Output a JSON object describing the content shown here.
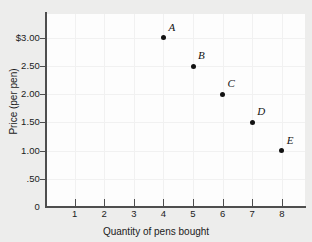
{
  "chart_data": {
    "type": "scatter",
    "title": "",
    "xlabel": "Quantity of pens bought",
    "ylabel": "Price (per pen)",
    "xlim": [
      0,
      8.8
    ],
    "ylim": [
      0,
      3.25
    ],
    "grid": true,
    "legend": "none",
    "x_ticks": [
      {
        "value": 1,
        "label": "1"
      },
      {
        "value": 2,
        "label": "2"
      },
      {
        "value": 3,
        "label": "3"
      },
      {
        "value": 4,
        "label": "4"
      },
      {
        "value": 5,
        "label": "5"
      },
      {
        "value": 6,
        "label": "6"
      },
      {
        "value": 7,
        "label": "7"
      },
      {
        "value": 8,
        "label": "8"
      }
    ],
    "y_ticks": [
      {
        "value": 3.0,
        "label": "$3.00"
      },
      {
        "value": 2.5,
        "label": "2.50"
      },
      {
        "value": 2.0,
        "label": "2.00"
      },
      {
        "value": 1.5,
        "label": "1.50"
      },
      {
        "value": 1.0,
        "label": "1.00"
      },
      {
        "value": 0.5,
        ".label": "",
        "label": ".50"
      },
      {
        "value": 0.0,
        "label": "0"
      }
    ],
    "origin_label": "0",
    "points": [
      {
        "label": "A",
        "x": 4,
        "y": 3.0
      },
      {
        "label": "B",
        "x": 5,
        "y": 2.5
      },
      {
        "label": "C",
        "x": 6,
        "y": 2.0
      },
      {
        "label": "D",
        "x": 7,
        "y": 1.5
      },
      {
        "label": "E",
        "x": 8,
        "y": 1.0
      }
    ],
    "colors": {
      "background": "#ededec",
      "plot_background": "#fdfdfd",
      "axis": "#4e4e4e",
      "gridline": "#f1f1f1",
      "point": "#121212",
      "text": "#1b1b1b"
    }
  }
}
